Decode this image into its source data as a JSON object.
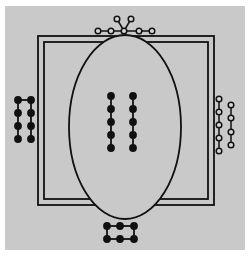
{
  "figure": {
    "colors": {
      "background": "#c9c9c9",
      "page": "#ffffff",
      "line": "#111111",
      "open_bead_fill": "#d6d6d6"
    }
  },
  "elements": {
    "frame": {
      "shape": "double-square",
      "label": "outer frame"
    },
    "ellipse": {
      "shape": "ellipse",
      "label": "central body"
    },
    "top_molecule": {
      "style": "open-circles",
      "nodes": 7,
      "layout": "chain of 5 with 2-branch fork at center"
    },
    "left_molecule": {
      "style": "filled-circles",
      "nodes": 8,
      "layout": "2 parallel columns of 4 joined at top"
    },
    "right_molecule": {
      "style": "open-circles",
      "nodes": 9,
      "layout": "2 separate columns of 5 and 4"
    },
    "center_molecule": {
      "style": "filled-circles",
      "nodes": 10,
      "layout": "2 separate columns of 5"
    },
    "bottom_molecule": {
      "style": "filled-circles",
      "nodes": 6,
      "layout": "closed rectangular ring 3x2"
    }
  }
}
